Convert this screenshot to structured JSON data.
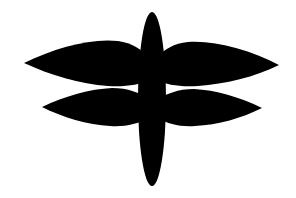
{
  "image": {
    "subject": "dragonfly",
    "description": "Black dragonfly silhouette icon on white background",
    "colors": {
      "fill": "#000000",
      "background": "#ffffff"
    },
    "parts": [
      "body",
      "upper-left-wing",
      "upper-right-wing",
      "lower-left-wing",
      "lower-right-wing"
    ]
  }
}
